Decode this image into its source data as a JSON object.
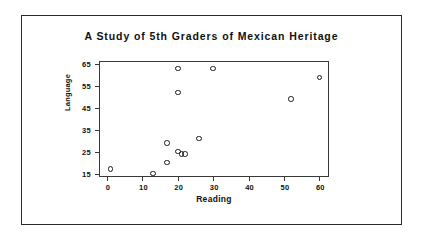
{
  "chart_data": {
    "type": "scatter",
    "title": "A Study of 5th Graders of Mexican Heritage",
    "xlabel": "Reading",
    "ylabel": "Language",
    "xlim": [
      -2,
      63
    ],
    "ylim": [
      13,
      66
    ],
    "xticks": [
      0,
      10,
      20,
      30,
      40,
      50,
      60
    ],
    "yticks": [
      15,
      25,
      35,
      45,
      55,
      65
    ],
    "grid": false,
    "legend": null,
    "marker": "open-circle",
    "marker_color": "#1a1a1a",
    "points": [
      {
        "x": 1,
        "y": 17
      },
      {
        "x": 13,
        "y": 15
      },
      {
        "x": 17,
        "y": 29
      },
      {
        "x": 17,
        "y": 20
      },
      {
        "x": 20,
        "y": 25
      },
      {
        "x": 20,
        "y": 52
      },
      {
        "x": 20,
        "y": 63
      },
      {
        "x": 21,
        "y": 24
      },
      {
        "x": 22,
        "y": 24
      },
      {
        "x": 26,
        "y": 31
      },
      {
        "x": 30,
        "y": 63
      },
      {
        "x": 52,
        "y": 49
      },
      {
        "x": 60,
        "y": 59
      }
    ]
  }
}
